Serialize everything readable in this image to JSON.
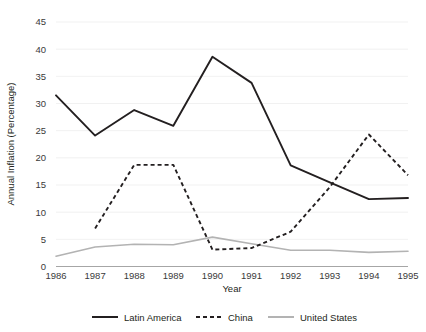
{
  "chart_data": {
    "type": "line",
    "title": "",
    "xlabel": "Year",
    "ylabel": "Annual Inflation (Percentage)",
    "categories": [
      "1986",
      "1987",
      "1988",
      "1989",
      "1990",
      "1991",
      "1992",
      "1993",
      "1994",
      "1995"
    ],
    "x": [
      1986,
      1987,
      1988,
      1989,
      1990,
      1991,
      1992,
      1993,
      1994,
      1995
    ],
    "xlim": [
      1986,
      1995
    ],
    "ylim": [
      0,
      45
    ],
    "ytick_labels": [
      "0",
      "5",
      "10",
      "15",
      "20",
      "25",
      "30",
      "35",
      "40",
      "45"
    ],
    "yticks": [
      0,
      5,
      10,
      15,
      20,
      25,
      30,
      35,
      40,
      45
    ],
    "grid": "horizontal",
    "legend_position": "bottom",
    "series": [
      {
        "name": "Latin America",
        "style": "solid",
        "color": "#231f20",
        "values": [
          31.5,
          24.1,
          28.8,
          25.9,
          38.6,
          33.8,
          18.6,
          15.5,
          12.4,
          12.6
        ]
      },
      {
        "name": "China",
        "style": "dashed",
        "color": "#231f20",
        "values": [
          null,
          7.0,
          18.7,
          18.7,
          3.1,
          3.4,
          6.4,
          14.6,
          24.3,
          16.8
        ]
      },
      {
        "name": "United States",
        "style": "solid",
        "color": "#b3b3b3",
        "values": [
          1.9,
          3.6,
          4.1,
          4.0,
          5.4,
          4.2,
          3.0,
          3.0,
          2.6,
          2.8
        ]
      }
    ]
  },
  "legend": {
    "items": [
      {
        "label": "Latin America"
      },
      {
        "label": "China"
      },
      {
        "label": "United States"
      }
    ]
  }
}
